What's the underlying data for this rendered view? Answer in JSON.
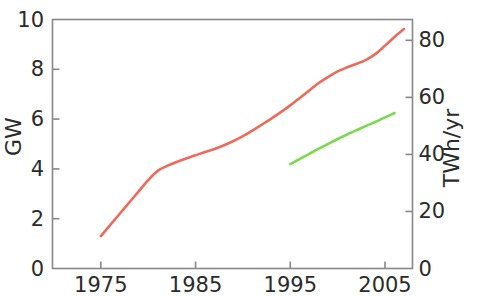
{
  "chart_data": {
    "type": "line",
    "title": "",
    "subtitle": "",
    "xlabel": "",
    "ylabel": "GW",
    "y2label": "TWh/yr",
    "xlim": [
      1969.9,
      2007.9
    ],
    "ylim": [
      0,
      10
    ],
    "y2lim": [
      0,
      87.3
    ],
    "grid": false,
    "legend": "none",
    "xticks": [
      1975,
      1985,
      1995,
      2005
    ],
    "xticklabels": [
      "1975",
      "1985",
      "1995",
      "2005"
    ],
    "yticks": [
      0,
      2,
      4,
      6,
      8,
      10
    ],
    "yticklabels": [
      "0",
      "2",
      "4",
      "6",
      "8",
      "10"
    ],
    "y2ticks": [
      0,
      20,
      40,
      60,
      80
    ],
    "y2ticklabels": [
      "0",
      "20",
      "40",
      "60",
      "80"
    ],
    "series": [
      {
        "name": "GW capacity",
        "axis": "left",
        "color": "#ee6a5a",
        "x": [
          1975,
          1976,
          1977,
          1978,
          1979,
          1980,
          1981,
          1982,
          1983,
          1984,
          1985,
          1986,
          1987,
          1988,
          1989,
          1990,
          1991,
          1992,
          1993,
          1994,
          1995,
          1996,
          1997,
          1998,
          1999,
          2000,
          2001,
          2002,
          2003,
          2004,
          2005,
          2006,
          2007
        ],
        "y": [
          1.3,
          1.75,
          2.2,
          2.65,
          3.1,
          3.55,
          3.92,
          4.12,
          4.28,
          4.42,
          4.55,
          4.68,
          4.8,
          4.95,
          5.12,
          5.32,
          5.54,
          5.78,
          6.02,
          6.28,
          6.55,
          6.85,
          7.15,
          7.45,
          7.7,
          7.92,
          8.08,
          8.22,
          8.38,
          8.62,
          8.95,
          9.3,
          9.62
        ]
      },
      {
        "name": "TWh/yr generation",
        "axis": "right",
        "color": "#7bd94f",
        "x": [
          1995,
          1996,
          1997,
          1998,
          1999,
          2000,
          2001,
          2002,
          2003,
          2004,
          2005,
          2006
        ],
        "y": [
          36.6,
          38.4,
          40.2,
          42.0,
          43.7,
          45.4,
          47.0,
          48.5,
          50.0,
          51.4,
          53.0,
          54.5
        ]
      }
    ]
  },
  "axes": {
    "left_title": "GW",
    "right_title": "TWh/yr"
  }
}
